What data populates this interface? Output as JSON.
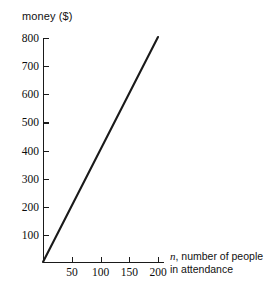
{
  "chart_data": {
    "type": "line",
    "title": "",
    "ylabel": "money ($)",
    "xlabel": "n, number of people in attendance",
    "xlabel_variable": "n",
    "xlabel_rest": ", number of people",
    "xlabel_line2": "in attendance",
    "x": [
      0,
      200
    ],
    "values": [
      0,
      800
    ],
    "series": [
      {
        "name": "money",
        "x": [
          0,
          200
        ],
        "values": [
          0,
          800
        ]
      }
    ],
    "slope": 4,
    "intercept": 0,
    "xlim": [
      0,
      215
    ],
    "ylim": [
      0,
      830
    ],
    "x_ticks": [
      50,
      100,
      150,
      200
    ],
    "x_tick_labels": [
      "50",
      "100",
      "150",
      "200"
    ],
    "y_ticks": [
      100,
      200,
      300,
      400,
      500,
      600,
      700,
      800
    ],
    "y_tick_labels": [
      "100",
      "200",
      "300",
      "400",
      "500",
      "600",
      "700",
      "800"
    ],
    "grid": false,
    "legend": false,
    "line_color": "#1a1a1a",
    "axis_color": "#1a1a1a",
    "background_color": "#ffffff"
  }
}
